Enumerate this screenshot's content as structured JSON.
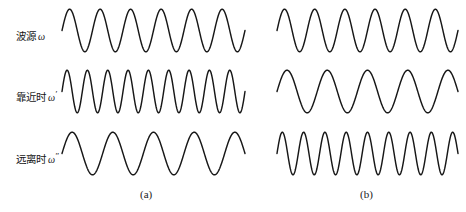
{
  "figure": {
    "title_none": "",
    "stroke_color": "#171717",
    "background_color": "#ffffff",
    "row_labels": [
      {
        "text": "波源",
        "symbol": "ω",
        "prime": ""
      },
      {
        "text": "靠近时",
        "symbol": "ω",
        "prime": "′"
      },
      {
        "text": "远离时",
        "symbol": "ω",
        "prime": "″"
      }
    ],
    "captions": [
      {
        "label": "(a)"
      },
      {
        "label": "(b)"
      }
    ]
  },
  "chart_data": {
    "type": "line",
    "title": "",
    "xlabel": "",
    "ylabel": "",
    "grid": false,
    "legend": "none",
    "panels": [
      {
        "name": "(a)",
        "caption": "(a)",
        "series": [
          {
            "name": "波源 ω",
            "row": 1,
            "cycles": 6,
            "amplitude": 1.0,
            "relative_frequency": 1.0
          },
          {
            "name": "靠近时 ω′",
            "row": 2,
            "cycles": 9,
            "amplitude": 1.0,
            "relative_frequency": 1.5
          },
          {
            "name": "远离时 ω″",
            "row": 3,
            "cycles": 4.5,
            "amplitude": 1.0,
            "relative_frequency": 0.75
          }
        ]
      },
      {
        "name": "(b)",
        "caption": "(b)",
        "series": [
          {
            "name": "波源 ω",
            "row": 1,
            "cycles": 6,
            "amplitude": 1.0,
            "relative_frequency": 1.0
          },
          {
            "name": "靠近时 ω′",
            "row": 2,
            "cycles": 4.5,
            "amplitude": 1.0,
            "relative_frequency": 0.75
          },
          {
            "name": "远离时 ω″",
            "row": 3,
            "cycles": 8.5,
            "amplitude": 1.0,
            "relative_frequency": 1.42
          }
        ]
      }
    ],
    "waves": [
      {
        "id": "a1",
        "x": 62,
        "y": 8,
        "width": 183,
        "height": 45,
        "cycles": 6,
        "phase": 0.0
      },
      {
        "id": "b1",
        "x": 277,
        "y": 8,
        "width": 181,
        "height": 45,
        "cycles": 6,
        "phase": 0.0
      },
      {
        "id": "a2",
        "x": 62,
        "y": 69,
        "width": 183,
        "height": 45,
        "cycles": 9,
        "phase": 0.0
      },
      {
        "id": "b2",
        "x": 277,
        "y": 69,
        "width": 181,
        "height": 45,
        "cycles": 4.5,
        "phase": 0.0
      },
      {
        "id": "a3",
        "x": 62,
        "y": 131,
        "width": 183,
        "height": 45,
        "cycles": 4.5,
        "phase": 0.0
      },
      {
        "id": "b3",
        "x": 277,
        "y": 131,
        "width": 181,
        "height": 45,
        "cycles": 8.5,
        "phase": 0.0
      }
    ]
  },
  "layout": {
    "labels": [
      {
        "x": 16,
        "y": 28
      },
      {
        "x": 16,
        "y": 89
      },
      {
        "x": 16,
        "y": 151
      }
    ],
    "captions": [
      {
        "x": 140,
        "y": 188
      },
      {
        "x": 360,
        "y": 188
      }
    ]
  }
}
